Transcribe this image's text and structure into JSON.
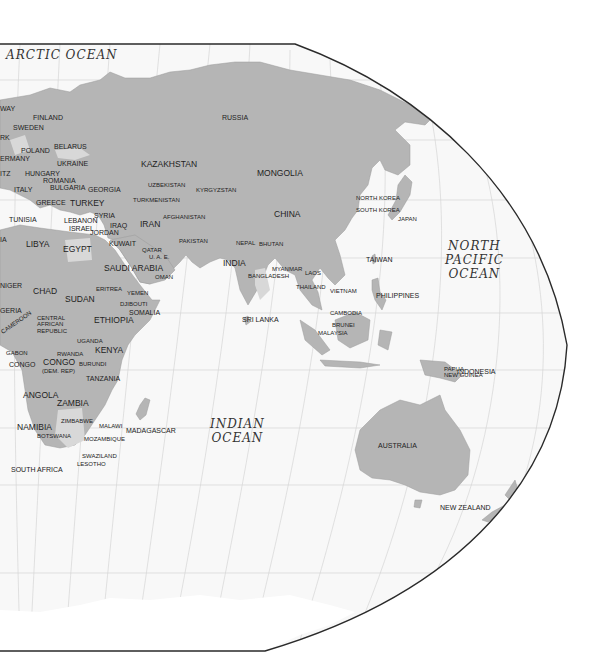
{
  "map": {
    "projection": "world-map-eastern-hemisphere",
    "colors": {
      "ocean": "#ffffff",
      "ocean_inside_frame": "#f7f7f7",
      "land": "#b4b4b4",
      "land_light": "#d2d2d2",
      "frame": "#2a2a2a",
      "graticule": "#d0d0d0",
      "label": "#222222"
    },
    "oceans": [
      {
        "name": "ARCTIC OCEAN",
        "lines": [
          "ARCTIC OCEAN"
        ]
      },
      {
        "name": "NORTH PACIFIC OCEAN",
        "lines": [
          "NORTH",
          "PACIFIC",
          "OCEAN"
        ]
      },
      {
        "name": "INDIAN OCEAN",
        "lines": [
          "INDIAN",
          "OCEAN"
        ]
      }
    ],
    "countries": [
      "WAY",
      "FINLAND",
      "SWEDEN",
      "RK",
      "POLAND",
      "BELARUS",
      "ERMANY",
      "UKRAINE",
      "ITZ",
      "HUNGARY",
      "ROMANIA",
      "BULGARIA",
      "GEORGIA",
      "ITALY",
      "GREECE",
      "TURKEY",
      "TUNISIA",
      "LEBANON",
      "SYRIA",
      "ISRAEL",
      "IRAQ",
      "JORDAN",
      "IRAN",
      "KUWAIT",
      "RUSSIA",
      "KAZAKHSTAN",
      "UZBEKISTAN",
      "KYRGYZSTAN",
      "TURKMENISTAN",
      "AFGHANISTAN",
      "MONGOLIA",
      "CHINA",
      "NORTH KOREA",
      "SOUTH KOREA",
      "JAPAN",
      "PAKISTAN",
      "QATAR",
      "U. A. E.",
      "NEPAL",
      "BHUTAN",
      "INDIA",
      "LIBYA",
      "EGYPT",
      "SAUDI ARABIA",
      "OMAN",
      "IA",
      "MYANMAR",
      "BANGLADESH",
      "LAOS",
      "TAIWAN",
      "THAILAND",
      "VIETNAM",
      "NIGER",
      "CHAD",
      "SUDAN",
      "ERITREA",
      "YEMEN",
      "DJIBOUTI",
      "SOMALIA",
      "PHILIPPINES",
      "GERIA",
      "CENTRAL AFRICAN REPUBLIC",
      "ETHIOPIA",
      "SRI LANKA",
      "CAMBODIA",
      "BRUNEI",
      "MALAYSIA",
      "CAMEROON",
      "UGANDA",
      "KENYA",
      "GABON",
      "RWANDA",
      "CONGO",
      "CONGO (DEM. REP)",
      "BURUNDI",
      "INDONESIA",
      "PAPUA NEW GUINEA",
      "TANZANIA",
      "ANGOLA",
      "ZAMBIA",
      "ZIMBABWE",
      "MALAWI",
      "NAMIBIA",
      "BOTSWANA",
      "MOZAMBIQUE",
      "MADAGASCAR",
      "AUSTRALIA",
      "SWAZILAND",
      "LESOTHO",
      "SOUTH AFRICA",
      "NEW ZEALAND"
    ],
    "labels": {
      "way": "WAY",
      "finland": "FINLAND",
      "sweden": "SWEDEN",
      "rk": "RK",
      "poland": "POLAND",
      "belarus": "BELARUS",
      "ermany": "ERMANY",
      "ukraine": "UKRAINE",
      "itz": "ITZ",
      "hungary": "HUNGARY",
      "romania": "ROMANIA",
      "bulgaria": "BULGARIA",
      "georgia": "GEORGIA",
      "italy": "ITALY",
      "greece": "GREECE",
      "turkey": "TURKEY",
      "tunisia": "TUNISIA",
      "lebanon": "LEBANON",
      "syria": "SYRIA",
      "israel": "ISRAEL",
      "iraq": "IRAQ",
      "jordan": "JORDAN",
      "iran": "IRAN",
      "kuwait": "KUWAIT",
      "russia": "RUSSIA",
      "kazakhstan": "KAZAKHSTAN",
      "uzbekistan": "UZBEKISTAN",
      "kyrgyzstan": "KYRGYZSTAN",
      "turkmenistan": "TURKMENISTAN",
      "afghanistan": "AFGHANISTAN",
      "mongolia": "MONGOLIA",
      "china": "CHINA",
      "north_korea": "NORTH KOREA",
      "south_korea": "SOUTH KOREA",
      "japan": "JAPAN",
      "pakistan": "PAKISTAN",
      "qatar": "QATAR",
      "uae": "U. A. E.",
      "nepal": "NEPAL",
      "bhutan": "BHUTAN",
      "india": "INDIA",
      "libya": "LIBYA",
      "egypt": "EGYPT",
      "saudi_arabia": "SAUDI ARABIA",
      "oman": "OMAN",
      "ia": "IA",
      "myanmar": "MYANMAR",
      "bangladesh": "BANGLADESH",
      "laos": "LAOS",
      "taiwan": "TAIWAN",
      "thailand": "THAILAND",
      "vietnam": "VIETNAM",
      "niger": "NIGER",
      "chad": "CHAD",
      "sudan": "SUDAN",
      "eritrea": "ERITREA",
      "yemen": "YEMEN",
      "djibouti": "DJIBOUTI",
      "somalia": "SOMALIA",
      "philippines": "PHILIPPINES",
      "geria": "GERIA",
      "car_1": "CENTRAL",
      "car_2": "AFRICAN",
      "car_3": "REPUBLIC",
      "ethiopia": "ETHIOPIA",
      "sri_lanka": "SRI LANKA",
      "cambodia": "CAMBODIA",
      "brunei": "BRUNEI",
      "malaysia": "MALAYSIA",
      "cameroon": "CAMEROON",
      "uganda": "UGANDA",
      "kenya": "KENYA",
      "gabon": "GABON",
      "rwanda": "RWANDA",
      "congo": "CONGO",
      "congo_dr": "CONGO",
      "congo_dr_sub": "(DEM. REP)",
      "burundi": "BURUNDI",
      "indonesia": "INDONESIA",
      "png_1": "PAPUA",
      "png_2": "NEW GUINEA",
      "tanzania": "TANZANIA",
      "angola": "ANGOLA",
      "zambia": "ZAMBIA",
      "zimbabwe": "ZIMBABWE",
      "malawi": "MALAWI",
      "namibia": "NAMIBIA",
      "botswana": "BOTSWANA",
      "mozambique": "MOZAMBIQUE",
      "madagascar": "MADAGASCAR",
      "australia": "AUSTRALIA",
      "swaziland": "SWAZILAND",
      "lesotho": "LESOTHO",
      "south_africa": "SOUTH AFRICA",
      "new_zealand": "NEW ZEALAND",
      "arctic": "ARCTIC OCEAN",
      "npac_1": "NORTH",
      "npac_2": "PACIFIC",
      "npac_3": "OCEAN",
      "indian_1": "INDIAN",
      "indian_2": "OCEAN"
    }
  }
}
